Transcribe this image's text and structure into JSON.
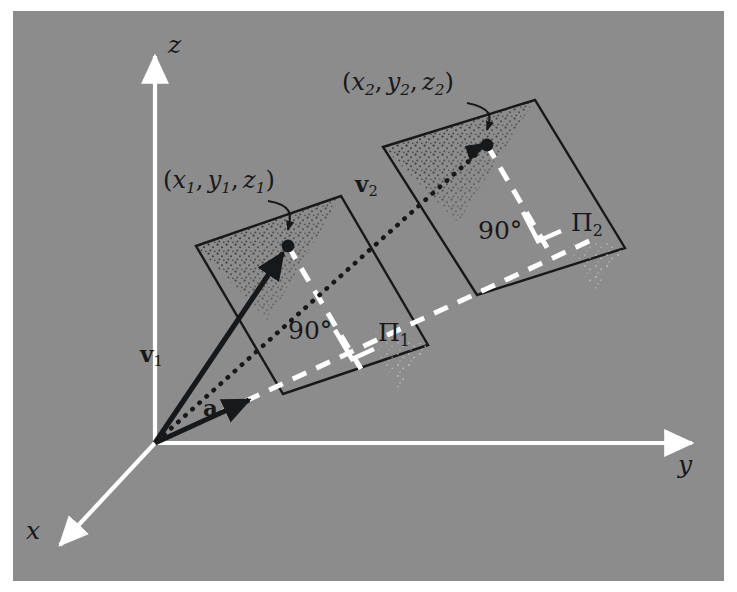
{
  "figure": {
    "kind": "3d-vector-projection-diagram",
    "background_color": "#8c8c8c",
    "margin_color": "#ffffff",
    "axis_color": "#ffffff",
    "ink_color": "#17181a",
    "dashed_color": "#ffffff",
    "stipple_color": "#2a2a2a",
    "width": 737,
    "height": 592
  },
  "axes": {
    "origin": {
      "x": 155,
      "y": 443
    },
    "items": [
      {
        "name": "z-axis",
        "label": "z",
        "tip": {
          "x": 155,
          "y": 48
        },
        "label_pos": {
          "x": 168,
          "y": 40
        }
      },
      {
        "name": "y-axis",
        "label": "y",
        "tip": {
          "x": 700,
          "y": 443
        },
        "label_pos": {
          "x": 680,
          "y": 455
        }
      },
      {
        "name": "x-axis",
        "label": "x",
        "tip": {
          "x": 52,
          "y": 552
        },
        "label_pos": {
          "x": 28,
          "y": 525
        }
      }
    ]
  },
  "vectors": [
    {
      "name": "vector-v1",
      "label": "v",
      "label_sub": "1",
      "bold": true,
      "style": "solid-arrow",
      "from": {
        "x": 155,
        "y": 443
      },
      "to": {
        "x": 288,
        "y": 246
      },
      "label_pos": {
        "x": 142,
        "y": 352
      }
    },
    {
      "name": "vector-v2",
      "label": "v",
      "label_sub": "2",
      "bold": true,
      "style": "dotted-arrow",
      "from": {
        "x": 155,
        "y": 443
      },
      "to": {
        "x": 487,
        "y": 145
      },
      "label_pos": {
        "x": 357,
        "y": 182
      }
    },
    {
      "name": "vector-a",
      "label": "a",
      "label_sub": "",
      "bold": true,
      "style": "solid-arrow",
      "from": {
        "x": 155,
        "y": 443
      },
      "to": {
        "x": 254,
        "y": 397
      },
      "label_pos": {
        "x": 200,
        "y": 405
      }
    }
  ],
  "points": [
    {
      "name": "point-p1",
      "label_open": "(",
      "vars": [
        {
          "v": "x",
          "s": "1"
        },
        {
          "v": "y",
          "s": "1"
        },
        {
          "v": "z",
          "s": "1"
        }
      ],
      "label_close": ")",
      "at": {
        "x": 288,
        "y": 246
      },
      "label_pos": {
        "x": 168,
        "y": 178
      }
    },
    {
      "name": "point-p2",
      "label_open": "(",
      "vars": [
        {
          "v": "x",
          "s": "2"
        },
        {
          "v": "y",
          "s": "2"
        },
        {
          "v": "z",
          "s": "2"
        }
      ],
      "label_close": ")",
      "at": {
        "x": 487,
        "y": 145
      },
      "label_pos": {
        "x": 347,
        "y": 92
      }
    }
  ],
  "planes": [
    {
      "name": "plane-pi-1",
      "label": "Π",
      "label_sub": "1",
      "label_pos": {
        "x": 381,
        "y": 329
      },
      "corners": [
        {
          "x": 196,
          "y": 246
        },
        {
          "x": 341,
          "y": 196
        },
        {
          "x": 428,
          "y": 345
        },
        {
          "x": 283,
          "y": 394
        }
      ],
      "shaded_triangle": [
        {
          "x": 196,
          "y": 246
        },
        {
          "x": 341,
          "y": 196
        },
        {
          "x": 268,
          "y": 321
        }
      ]
    },
    {
      "name": "plane-pi-2",
      "label": "Π",
      "label_sub": "2",
      "label_pos": {
        "x": 575,
        "y": 219
      },
      "corners": [
        {
          "x": 383,
          "y": 147
        },
        {
          "x": 535,
          "y": 100
        },
        {
          "x": 625,
          "y": 248
        },
        {
          "x": 477,
          "y": 295
        }
      ],
      "shaded_triangle": [
        {
          "x": 383,
          "y": 147
        },
        {
          "x": 535,
          "y": 100
        },
        {
          "x": 458,
          "y": 223
        }
      ]
    }
  ],
  "angles": [
    {
      "name": "right-angle-marker-1",
      "label": "90°",
      "label_pos": {
        "x": 292,
        "y": 323
      },
      "vertex": {
        "x": 361,
        "y": 344
      },
      "perp_to": {
        "x": 288,
        "y": 246
      }
    },
    {
      "name": "right-angle-marker-2",
      "label": "90°",
      "label_pos": {
        "x": 483,
        "y": 224
      },
      "vertex": {
        "x": 546,
        "y": 247
      },
      "perp_to": {
        "x": 487,
        "y": 145
      }
    }
  ]
}
